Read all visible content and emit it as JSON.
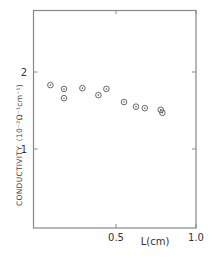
{
  "chart_data": {
    "type": "scatter",
    "title": "",
    "xlabel": "L(cm)",
    "ylabel": "CONDUCTIVITY (10⁻²Ω⁻¹cm⁻¹)",
    "xlim": [
      0,
      1.0
    ],
    "ylim": [
      0,
      2.8
    ],
    "x_ticks": [
      {
        "value": 0.5,
        "label": "0.5"
      },
      {
        "value": 1.0,
        "label": "1.0"
      }
    ],
    "y_ticks": [
      {
        "value": 1,
        "label": "1"
      },
      {
        "value": 2,
        "label": "2"
      }
    ],
    "grid": false,
    "marker": "circle-dot",
    "series": [
      {
        "name": "conductivity",
        "points": [
          {
            "x": 0.09,
            "y": 1.83
          },
          {
            "x": 0.175,
            "y": 1.78
          },
          {
            "x": 0.175,
            "y": 1.66
          },
          {
            "x": 0.29,
            "y": 1.79
          },
          {
            "x": 0.39,
            "y": 1.7
          },
          {
            "x": 0.44,
            "y": 1.78
          },
          {
            "x": 0.55,
            "y": 1.61
          },
          {
            "x": 0.625,
            "y": 1.55
          },
          {
            "x": 0.68,
            "y": 1.53
          },
          {
            "x": 0.78,
            "y": 1.51
          },
          {
            "x": 0.79,
            "y": 1.47
          }
        ]
      }
    ]
  },
  "labels": {
    "xlabel": "L(cm)",
    "ylabel_main": "CONDUCTIVITY",
    "ylabel_unit": "(10⁻²Ω⁻¹cm⁻¹)",
    "x_tick_05": "0.5",
    "x_tick_10": "1.0",
    "y_tick_1": "1",
    "y_tick_2": "2"
  }
}
